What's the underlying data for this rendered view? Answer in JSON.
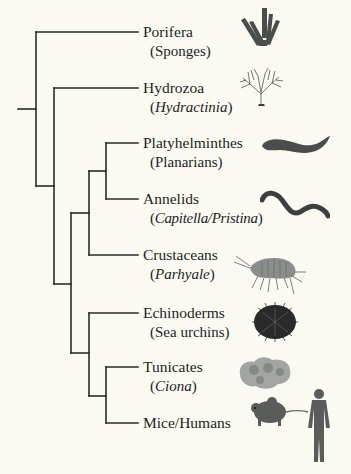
{
  "diagram": {
    "type": "phylogenetic-tree",
    "line_color": "#2a2a2a",
    "taxa": [
      {
        "name": "Porifera",
        "sub_open": "(",
        "sub_text": "Sponges",
        "sub_italic": false,
        "sub_close": ")",
        "icon": "sponge-icon"
      },
      {
        "name": "Hydrozoa",
        "sub_open": "(",
        "sub_text": "Hydractinia",
        "sub_italic": true,
        "sub_close": ")",
        "icon": "hydroid-icon"
      },
      {
        "name": "Platyhelminthes",
        "sub_open": "(",
        "sub_text": "Planarians",
        "sub_italic": false,
        "sub_close": ")",
        "icon": "planarian-icon"
      },
      {
        "name": "Annelids",
        "sub_open": "(",
        "sub_text": "Capitella/Pristina",
        "sub_italic": true,
        "sub_close": ")",
        "icon": "worm-icon"
      },
      {
        "name": "Crustaceans",
        "sub_open": "(",
        "sub_text": "Parhyale",
        "sub_italic": true,
        "sub_close": ")",
        "icon": "amphipod-icon"
      },
      {
        "name": "Echinoderms",
        "sub_open": "(",
        "sub_text": "Sea urchins",
        "sub_italic": false,
        "sub_close": ")",
        "icon": "sea-urchin-icon"
      },
      {
        "name": "Tunicates",
        "sub_open": "(",
        "sub_text": "Ciona",
        "sub_italic": true,
        "sub_close": ")",
        "icon": "tunicate-icon"
      },
      {
        "name": "Mice/Humans",
        "sub_open": "",
        "sub_text": "",
        "sub_italic": false,
        "sub_close": "",
        "icon": "mouse-human-icon"
      }
    ]
  }
}
